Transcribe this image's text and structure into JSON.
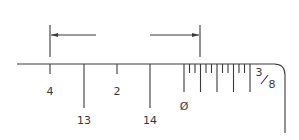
{
  "diagram": {
    "type": "scale-rule-detail",
    "scale_marker": {
      "numerator": "3",
      "denominator": "8"
    },
    "dimension": {
      "left_extension_x": 50,
      "right_extension_x": 200,
      "arrow_y": 35,
      "left_arrow_tail_x": 96,
      "right_arrow_tail_x": 150
    },
    "main_ticks": [
      {
        "x": 50,
        "length": "short",
        "label": "4",
        "label_row": "upper"
      },
      {
        "x": 84,
        "length": "long",
        "label": "13",
        "label_row": "lower"
      },
      {
        "x": 117,
        "length": "short",
        "label": "2",
        "label_row": "upper"
      },
      {
        "x": 150,
        "length": "long",
        "label": "14",
        "label_row": "lower"
      }
    ],
    "fine_scale": {
      "start_x": 184,
      "end_x": 250,
      "divisions": 12,
      "major_every": 3,
      "zero_label": "Ø"
    },
    "colors": {
      "line": "#3a3a3a",
      "background": "#ffffff"
    }
  }
}
